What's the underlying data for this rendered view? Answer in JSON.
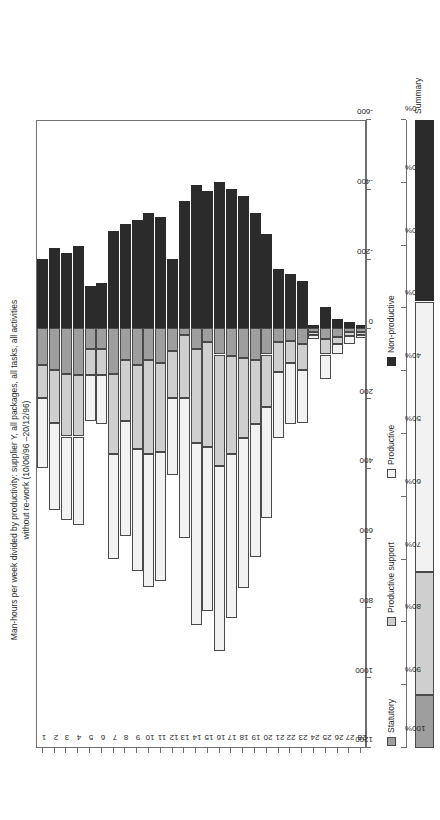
{
  "chart_data": {
    "type": "bar",
    "orientation": "horizontal-stacked",
    "title_lines": [
      "Man-hours per week divided by productivity: supplier Y, all packages, all tasks, all activities",
      "without re-work (10/06/96 –20/12/96)"
    ],
    "xlabel": "",
    "ylabel": "",
    "categories": [
      "1",
      "2",
      "3",
      "4",
      "5",
      "6",
      "7",
      "8",
      "9",
      "10",
      "11",
      "12",
      "13",
      "14",
      "15",
      "16",
      "17",
      "18",
      "19",
      "20",
      "21",
      "22",
      "23",
      "24",
      "25",
      "26",
      "27",
      "28"
    ],
    "value_axis": {
      "ticks": [
        1200,
        1000,
        800,
        600,
        400,
        200,
        0,
        -200,
        -400,
        -600
      ],
      "tick_labels": [
        "1200",
        "1000",
        "800",
        "600",
        "400",
        "200",
        "0",
        "-200",
        "-400",
        "-600"
      ],
      "min": -600,
      "max": 1200
    },
    "percent_axis": {
      "ticks": [
        100,
        90,
        80,
        70,
        60,
        50,
        40,
        30,
        20,
        10,
        0
      ],
      "tick_labels": [
        "100%",
        "90%",
        "80%",
        "70%",
        "60%",
        "50%",
        "40%",
        "30%",
        "20%",
        "10%",
        "0%"
      ],
      "min": 0,
      "max": 100
    },
    "legend": {
      "position": "bottom",
      "entries": [
        {
          "name": "Statutory",
          "color": "#9e9e9e"
        },
        {
          "name": "Productive support",
          "color": "#cfcfcf"
        },
        {
          "name": "Productive",
          "color": "#f2f2f2"
        },
        {
          "name": "Non-productive",
          "color": "#2b2b2b"
        }
      ]
    },
    "series": [
      {
        "name": "Statutory",
        "color": "#9e9e9e",
        "values": [
          105,
          120,
          130,
          135,
          60,
          60,
          130,
          90,
          105,
          90,
          100,
          65,
          20,
          60,
          40,
          75,
          80,
          85,
          90,
          75,
          40,
          35,
          45,
          10,
          30,
          25,
          10,
          10
        ]
      },
      {
        "name": "Productive support",
        "color": "#cfcfcf",
        "values": [
          95,
          150,
          180,
          175,
          75,
          75,
          230,
          175,
          240,
          270,
          255,
          135,
          180,
          270,
          300,
          320,
          280,
          230,
          185,
          150,
          85,
          65,
          75,
          8,
          45,
          20,
          12,
          8
        ]
      },
      {
        "name": "Productive",
        "color": "#f2f2f2",
        "values": [
          200,
          250,
          240,
          255,
          130,
          140,
          300,
          330,
          350,
          380,
          370,
          220,
          400,
          520,
          470,
          530,
          470,
          430,
          380,
          320,
          190,
          175,
          150,
          12,
          70,
          30,
          22,
          10
        ]
      },
      {
        "name": "Non-productive",
        "color": "#2b2b2b",
        "values": [
          -200,
          -230,
          -215,
          -235,
          -120,
          -130,
          -280,
          -300,
          -310,
          -330,
          -320,
          -200,
          -365,
          -410,
          -395,
          -420,
          -400,
          -380,
          -330,
          -270,
          -170,
          -155,
          -135,
          -10,
          -60,
          -28,
          -18,
          -9
        ]
      }
    ],
    "summary": {
      "label": "Summary",
      "segments": [
        {
          "name": "Statutory",
          "percent": 8.5,
          "color": "#9e9e9e"
        },
        {
          "name": "Productive support",
          "percent": 19.6,
          "color": "#cfcfcf"
        },
        {
          "name": "Productive",
          "percent": 43.0,
          "color": "#f2f2f2"
        },
        {
          "name": "Non-productive",
          "percent": 28.9,
          "color": "#2b2b2b"
        }
      ]
    }
  }
}
